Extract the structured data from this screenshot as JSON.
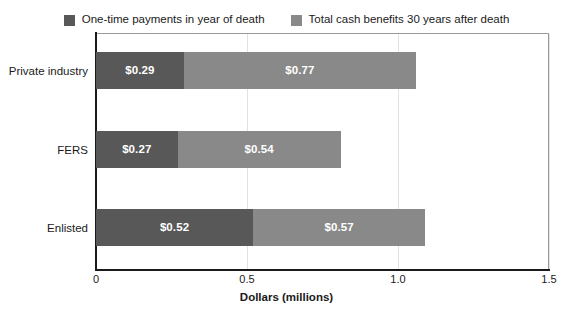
{
  "chart_data": {
    "type": "bar",
    "orientation": "horizontal",
    "stacked": true,
    "title": "",
    "subtitle": "",
    "xlabel": "Dollars (millions)",
    "ylabel": "",
    "categories": [
      "Private industry",
      "FERS",
      "Enlisted"
    ],
    "series": [
      {
        "name": "One-time payments in year of death",
        "color": "#585858",
        "values": [
          0.29,
          0.27,
          0.52
        ],
        "labels": [
          "$0.29",
          "$0.27",
          "$0.52"
        ]
      },
      {
        "name": "Total cash benefits 30 years after death",
        "color": "#898989",
        "values": [
          0.77,
          0.54,
          0.57
        ],
        "labels": [
          "$0.77",
          "$0.54",
          "$0.57"
        ]
      }
    ],
    "totals": [
      1.06,
      0.81,
      1.09
    ],
    "xlim": [
      0,
      1.5
    ],
    "xticks": [
      0,
      0.5,
      1.0,
      1.5
    ],
    "xtick_labels": [
      "0",
      "0.5",
      "1.0",
      "1.5"
    ],
    "grid": true,
    "grid_axis": "x",
    "legend_position": "top"
  },
  "legend": {
    "entries": [
      {
        "label": "One-time payments in year of death",
        "swatch_name": "legend-swatch-one-time-payments"
      },
      {
        "label": "Total cash benefits 30 years after death",
        "swatch_name": "legend-swatch-total-cash-benefits"
      }
    ]
  },
  "axis": {
    "x_label": "Dollars (millions)",
    "ticks": [
      "0",
      "0.5",
      "1.0",
      "1.5"
    ]
  },
  "colors": {
    "series_dark": "#585858",
    "series_light": "#898989",
    "axis": "#1a1a1a",
    "gridline": "#e2e2e2",
    "value_text": "#ffffff",
    "background": "#ffffff"
  }
}
